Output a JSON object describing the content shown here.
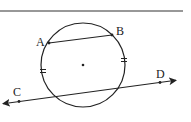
{
  "diagram": {
    "type": "geometry",
    "colors": {
      "stroke": "#222222",
      "background": "#ffffff"
    },
    "top_rule": {
      "x1": 0,
      "y1": 11,
      "x2": 183,
      "y2": 11
    },
    "circle": {
      "cx": 83,
      "cy": 65,
      "r": 42,
      "center_dot": true
    },
    "points": [
      {
        "label": "A",
        "x": 49,
        "y": 43,
        "label_x": 36,
        "label_y": 46
      },
      {
        "label": "B",
        "x": 112,
        "y": 35,
        "label_x": 116,
        "label_y": 35
      },
      {
        "label": "C",
        "x": 19,
        "y": 101,
        "label_x": 13,
        "label_y": 96
      },
      {
        "label": "D",
        "x": 160,
        "y": 82,
        "label_x": 156,
        "label_y": 78
      }
    ],
    "chord_AB": {
      "from": "A",
      "to": "B"
    },
    "line_CD": {
      "x1": 1,
      "y1": 104,
      "x2": 178,
      "y2": 80,
      "arrows": "both"
    },
    "congruence_ticks": [
      {
        "x": 43,
        "y": 71,
        "count": 2
      },
      {
        "x": 124,
        "y": 60,
        "count": 2
      }
    ]
  }
}
